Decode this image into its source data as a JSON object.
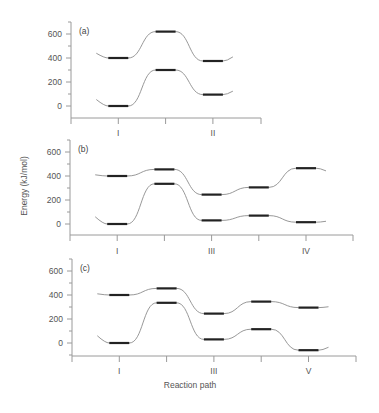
{
  "chart_data": [
    {
      "type": "line",
      "panel_label": "(a)",
      "title": "",
      "xlabel": "",
      "ylabel": "",
      "ylim": [
        -100,
        700
      ],
      "yticks": [
        0,
        200,
        400,
        600
      ],
      "xtick_positions": [
        1,
        2,
        3,
        4
      ],
      "xtick_labels": [
        "I",
        "",
        "II",
        ""
      ],
      "grid": false,
      "series": [
        {
          "name": "upper",
          "x": [
            1,
            2,
            3
          ],
          "values": [
            400,
            620,
            375
          ]
        },
        {
          "name": "lower",
          "x": [
            1,
            2,
            3
          ],
          "values": [
            0,
            300,
            95
          ]
        }
      ]
    },
    {
      "type": "line",
      "panel_label": "(b)",
      "title": "",
      "xlabel": "",
      "ylabel": "Energy (kJ/mol)",
      "ylim": [
        -100,
        700
      ],
      "yticks": [
        0,
        200,
        400,
        600
      ],
      "xtick_positions": [
        1,
        2,
        3,
        4,
        5,
        6
      ],
      "xtick_labels": [
        "I",
        "",
        "III",
        "",
        "IV",
        ""
      ],
      "grid": false,
      "series": [
        {
          "name": "upper",
          "x": [
            1,
            2,
            3,
            4,
            5
          ],
          "values": [
            400,
            455,
            245,
            305,
            465
          ]
        },
        {
          "name": "lower",
          "x": [
            1,
            2,
            3,
            4,
            5
          ],
          "values": [
            0,
            335,
            30,
            70,
            15
          ]
        }
      ]
    },
    {
      "type": "line",
      "panel_label": "(c)",
      "title": "",
      "xlabel": "Reaction path",
      "ylabel": "",
      "ylim": [
        -100,
        700
      ],
      "yticks": [
        0,
        200,
        400,
        600
      ],
      "xtick_positions": [
        1,
        2,
        3,
        4,
        5,
        6
      ],
      "xtick_labels": [
        "I",
        "",
        "III",
        "",
        "V",
        ""
      ],
      "grid": false,
      "series": [
        {
          "name": "upper",
          "x": [
            1,
            2,
            3,
            4,
            5
          ],
          "values": [
            400,
            455,
            245,
            345,
            295
          ]
        },
        {
          "name": "lower",
          "x": [
            1,
            2,
            3,
            4,
            5
          ],
          "values": [
            0,
            335,
            30,
            115,
            -60
          ]
        }
      ]
    }
  ],
  "labels": {
    "panel_a": "(a)",
    "panel_b": "(b)",
    "panel_c": "(c)",
    "ylabel": "Energy (kJ/mol)",
    "xlabel": "Reaction path",
    "yticks": [
      "600",
      "400",
      "200",
      "0"
    ]
  },
  "colors": {
    "axis": "#9a9a9a",
    "curve": "#8c8c8c",
    "level": "#222222",
    "text": "#555555"
  }
}
